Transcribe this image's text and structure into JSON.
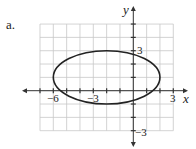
{
  "figure": {
    "part_label": "a.",
    "x_axis_label": "x",
    "y_axis_label": "y",
    "x_tick_labels": [
      {
        "value": -6,
        "text": "−6"
      },
      {
        "value": -3,
        "text": "−3"
      },
      {
        "value": 3,
        "text": "3"
      }
    ],
    "y_tick_labels": [
      {
        "value": 3,
        "text": "3"
      },
      {
        "value": -3,
        "text": "−3"
      }
    ]
  },
  "chart_data": {
    "type": "line",
    "title": "",
    "xlabel": "x",
    "ylabel": "y",
    "xlim": [
      -7,
      3
    ],
    "ylim": [
      -3,
      5
    ],
    "grid": true,
    "grid_step": 1,
    "series": [
      {
        "name": "ellipse",
        "shape": "ellipse",
        "center": [
          -2,
          1
        ],
        "semi_major_x": 4,
        "semi_minor_y": 2,
        "vertices": [
          [
            -6,
            1
          ],
          [
            2,
            1
          ]
        ],
        "co_vertices": [
          [
            -2,
            3
          ],
          [
            -2,
            -1
          ]
        ]
      }
    ],
    "colors": {
      "grid": "#c8c8c8",
      "axis": "#333333",
      "curve": "#222222"
    }
  }
}
